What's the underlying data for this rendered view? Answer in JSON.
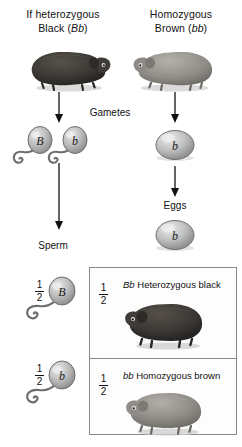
{
  "diagram": {
    "title_note": "Monohybrid cross: heterozygous black guinea pig x homozygous brown guinea pig",
    "parents": [
      {
        "id": "father",
        "line1": "If heterozygous",
        "line2_prefix": "Black (",
        "line2_genotype": "Bb",
        "line2_suffix": ")",
        "animal_color": "#3a3734",
        "animal_name": "black-guinea-pig"
      },
      {
        "id": "mother",
        "line1": "Homozygous",
        "line2_prefix": "Brown (",
        "line2_genotype": "bb",
        "line2_suffix": ")",
        "animal_color": "#8d8b86",
        "animal_name": "brown-guinea-pig"
      }
    ],
    "stage_labels": {
      "gametes": "Gametes",
      "eggs": "Eggs",
      "sperm": "Sperm"
    },
    "gametes": {
      "sperm_cells": [
        {
          "allele": "B"
        },
        {
          "allele": "b"
        }
      ],
      "egg_cells": [
        {
          "allele": "b"
        }
      ]
    },
    "eggs_row": {
      "allele": "b"
    },
    "sperm_row": [
      {
        "allele": "B",
        "fraction_num": "1",
        "fraction_den": "2"
      },
      {
        "allele": "b",
        "fraction_num": "1",
        "fraction_den": "2"
      }
    ],
    "offspring": [
      {
        "fraction_num": "1",
        "fraction_den": "2",
        "genotype": "Bb",
        "phenotype": " Heterozygous black",
        "animal_color": "#3a3734",
        "animal_name": "black-guinea-pig-offspring"
      },
      {
        "fraction_num": "1",
        "fraction_den": "2",
        "genotype": "bb",
        "phenotype": " Homozygous brown",
        "animal_color": "#8d8b86",
        "animal_name": "brown-guinea-pig-offspring"
      }
    ],
    "colors": {
      "black_coat": "#3a3734",
      "brown_coat": "#8d8b86",
      "gamete_fill": "#b9b9b9",
      "arrow": "#111111",
      "box_border": "#888888"
    }
  }
}
